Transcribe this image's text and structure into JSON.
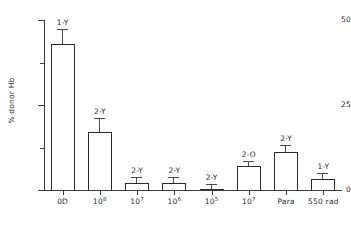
{
  "chart_data": {
    "type": "bar",
    "title": "",
    "subtitle": "",
    "xlabel": "",
    "ylabel": "% donor Hb",
    "ylim": [
      0,
      50
    ],
    "ytick_labels": [
      "0",
      "25",
      "50"
    ],
    "ytick_values": [
      0,
      25,
      50
    ],
    "yminor_values": [
      12.5,
      37.5
    ],
    "grid": false,
    "legend": "none",
    "categories": [
      "0D",
      "10⁸",
      "10⁷",
      "10⁶",
      "10⁵",
      "10⁷",
      "Para",
      "550 rad"
    ],
    "category_bases": [
      "0D",
      "10",
      "10",
      "10",
      "10",
      "10",
      "Para",
      "550 rad"
    ],
    "category_exponents": [
      "",
      "8",
      "7",
      "6",
      "5",
      "7",
      "",
      ""
    ],
    "values": [
      43,
      17,
      2.2,
      2.2,
      0.3,
      7.2,
      11.2,
      3.2
    ],
    "errors": [
      4.0,
      3.8,
      1.4,
      1.4,
      1.2,
      1.1,
      1.8,
      1.4
    ],
    "point_labels": [
      "1-Y",
      "2-Y",
      "2-Y",
      "2-Y",
      "2-Y",
      "2-O",
      "2-Y",
      "1-Y"
    ],
    "bar_facecolor": "#ffffff",
    "bar_edgecolor": "#2b2b2b",
    "axis_color": "#3a3a3a",
    "text_color": "#2a2a2a"
  }
}
